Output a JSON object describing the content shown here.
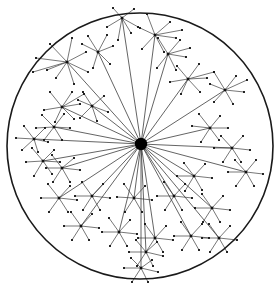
{
  "figure": {
    "type": "node-link-diagram",
    "width": 280,
    "height": 292,
    "background_color": "#ffffff"
  },
  "style": {
    "boundary_stroke": "#1a1a1a",
    "boundary_stroke_width": 1.6,
    "boundary_fill": "none",
    "spoke_stroke": "#3c3c3c",
    "spoke_stroke_width": 0.8,
    "branch_stroke": "#3c3c3c",
    "branch_stroke_width": 0.7,
    "hub_fill": "#000000",
    "cluster_node_fill": "#111111",
    "leaf_node_fill": "#111111",
    "hub_radius": 6.2,
    "cluster_node_size": 2.6,
    "leaf_node_size": 1.9
  },
  "boundary": {
    "label": "outer-circle-boundary",
    "cx": 140,
    "cy": 146,
    "r": 133
  },
  "hub": {
    "label": "central-hub-node",
    "cx": 141,
    "cy": 144,
    "r": 6.2,
    "degree": 29
  },
  "chart_data": {
    "type": "node-link-diagram",
    "node_count": 213,
    "cluster_count": 29,
    "clusters": [
      {
        "id": "c01",
        "x": 122,
        "y": 18,
        "leaves": [
          [
            113,
            8
          ],
          [
            134,
            9
          ],
          [
            107,
            27
          ],
          [
            131,
            33
          ],
          [
            118,
            40
          ],
          [
            140,
            28
          ]
        ]
      },
      {
        "id": "c02",
        "x": 155,
        "y": 35,
        "leaves": [
          [
            147,
            14
          ],
          [
            170,
            22
          ],
          [
            176,
            38
          ],
          [
            164,
            52
          ],
          [
            142,
            49
          ],
          [
            138,
            27
          ],
          [
            182,
            30
          ]
        ]
      },
      {
        "id": "c03",
        "x": 67,
        "y": 62,
        "leaves": [
          [
            50,
            44
          ],
          [
            72,
            38
          ],
          [
            86,
            52
          ],
          [
            88,
            72
          ],
          [
            74,
            84
          ],
          [
            56,
            78
          ],
          [
            36,
            58
          ],
          [
            47,
            70
          ],
          [
            33,
            72
          ]
        ]
      },
      {
        "id": "c04",
        "x": 98,
        "y": 52,
        "leaves": [
          [
            88,
            36
          ],
          [
            107,
            35
          ],
          [
            113,
            46
          ],
          [
            110,
            64
          ],
          [
            93,
            68
          ],
          [
            82,
            44
          ]
        ]
      },
      {
        "id": "c05",
        "x": 168,
        "y": 54,
        "leaves": [
          [
            158,
            38
          ],
          [
            180,
            40
          ],
          [
            186,
            57
          ],
          [
            176,
            70
          ],
          [
            157,
            68
          ],
          [
            190,
            48
          ]
        ]
      },
      {
        "id": "c06",
        "x": 188,
        "y": 79,
        "leaves": [
          [
            177,
            66
          ],
          [
            199,
            64
          ],
          [
            207,
            78
          ],
          [
            200,
            92
          ],
          [
            181,
            94
          ],
          [
            170,
            82
          ],
          [
            214,
            72
          ]
        ]
      },
      {
        "id": "c07",
        "x": 225,
        "y": 90,
        "leaves": [
          [
            214,
            72
          ],
          [
            236,
            76
          ],
          [
            244,
            92
          ],
          [
            233,
            104
          ],
          [
            214,
            102
          ],
          [
            210,
            84
          ],
          [
            247,
            80
          ]
        ]
      },
      {
        "id": "c08",
        "x": 62,
        "y": 107,
        "leaves": [
          [
            50,
            92
          ],
          [
            72,
            92
          ],
          [
            80,
            104
          ],
          [
            74,
            119
          ],
          [
            55,
            122
          ],
          [
            44,
            110
          ],
          [
            84,
            94
          ]
        ]
      },
      {
        "id": "c09",
        "x": 92,
        "y": 106,
        "leaves": [
          [
            83,
            92
          ],
          [
            104,
            96
          ],
          [
            108,
            112
          ],
          [
            97,
            121
          ],
          [
            80,
            118
          ],
          [
            78,
            100
          ]
        ]
      },
      {
        "id": "c10",
        "x": 210,
        "y": 128,
        "leaves": [
          [
            199,
            114
          ],
          [
            220,
            116
          ],
          [
            228,
            128
          ],
          [
            219,
            140
          ],
          [
            201,
            142
          ],
          [
            192,
            126
          ]
        ]
      },
      {
        "id": "c11",
        "x": 54,
        "y": 127,
        "leaves": [
          [
            42,
            115
          ],
          [
            64,
            114
          ],
          [
            70,
            128
          ],
          [
            62,
            140
          ],
          [
            44,
            140
          ],
          [
            36,
            128
          ]
        ]
      },
      {
        "id": "c12",
        "x": 34,
        "y": 139,
        "leaves": [
          [
            24,
            126
          ],
          [
            45,
            128
          ],
          [
            48,
            142
          ],
          [
            38,
            152
          ],
          [
            22,
            150
          ],
          [
            16,
            138
          ]
        ]
      },
      {
        "id": "c13",
        "x": 43,
        "y": 161,
        "leaves": [
          [
            32,
            148
          ],
          [
            54,
            150
          ],
          [
            60,
            162
          ],
          [
            52,
            174
          ],
          [
            34,
            176
          ],
          [
            26,
            162
          ]
        ]
      },
      {
        "id": "c14",
        "x": 62,
        "y": 168,
        "leaves": [
          [
            52,
            155
          ],
          [
            74,
            158
          ],
          [
            80,
            170
          ],
          [
            70,
            182
          ],
          [
            53,
            182
          ],
          [
            46,
            168
          ]
        ]
      },
      {
        "id": "c15",
        "x": 232,
        "y": 148,
        "leaves": [
          [
            221,
            136
          ],
          [
            243,
            136
          ],
          [
            250,
            150
          ],
          [
            241,
            162
          ],
          [
            223,
            162
          ],
          [
            214,
            148
          ]
        ]
      },
      {
        "id": "c16",
        "x": 246,
        "y": 172,
        "leaves": [
          [
            235,
            160
          ],
          [
            256,
            160
          ],
          [
            263,
            174
          ],
          [
            254,
            186
          ],
          [
            236,
            186
          ],
          [
            228,
            172
          ]
        ]
      },
      {
        "id": "c17",
        "x": 194,
        "y": 176,
        "leaves": [
          [
            184,
            163
          ],
          [
            205,
            164
          ],
          [
            212,
            178
          ],
          [
            202,
            190
          ],
          [
            185,
            191
          ],
          [
            177,
            176
          ]
        ]
      },
      {
        "id": "c18",
        "x": 59,
        "y": 198,
        "leaves": [
          [
            48,
            184
          ],
          [
            70,
            186
          ],
          [
            77,
            200
          ],
          [
            68,
            212
          ],
          [
            49,
            212
          ],
          [
            41,
            198
          ]
        ]
      },
      {
        "id": "c19",
        "x": 92,
        "y": 196,
        "leaves": [
          [
            82,
            182
          ],
          [
            103,
            184
          ],
          [
            110,
            198
          ],
          [
            100,
            210
          ],
          [
            83,
            210
          ],
          [
            75,
            196
          ]
        ]
      },
      {
        "id": "c20",
        "x": 134,
        "y": 198,
        "leaves": [
          [
            124,
            184
          ],
          [
            145,
            186
          ],
          [
            152,
            200
          ],
          [
            142,
            212
          ],
          [
            125,
            212
          ],
          [
            117,
            197
          ]
        ]
      },
      {
        "id": "c21",
        "x": 174,
        "y": 196,
        "leaves": [
          [
            164,
            182
          ],
          [
            185,
            184
          ],
          [
            192,
            198
          ],
          [
            182,
            210
          ],
          [
            165,
            210
          ],
          [
            157,
            196
          ]
        ]
      },
      {
        "id": "c22",
        "x": 212,
        "y": 208,
        "leaves": [
          [
            202,
            194
          ],
          [
            223,
            196
          ],
          [
            230,
            210
          ],
          [
            220,
            222
          ],
          [
            203,
            222
          ],
          [
            195,
            208
          ]
        ]
      },
      {
        "id": "c23",
        "x": 81,
        "y": 226,
        "leaves": [
          [
            71,
            212
          ],
          [
            92,
            214
          ],
          [
            99,
            228
          ],
          [
            89,
            240
          ],
          [
            72,
            240
          ],
          [
            64,
            226
          ]
        ]
      },
      {
        "id": "c24",
        "x": 119,
        "y": 232,
        "leaves": [
          [
            109,
            218
          ],
          [
            130,
            220
          ],
          [
            137,
            234
          ],
          [
            127,
            246
          ],
          [
            110,
            246
          ],
          [
            102,
            232
          ]
        ]
      },
      {
        "id": "c25",
        "x": 155,
        "y": 238,
        "leaves": [
          [
            145,
            224
          ],
          [
            166,
            226
          ],
          [
            173,
            240
          ],
          [
            163,
            252
          ],
          [
            146,
            252
          ],
          [
            138,
            238
          ]
        ]
      },
      {
        "id": "c26",
        "x": 191,
        "y": 236,
        "leaves": [
          [
            181,
            222
          ],
          [
            202,
            224
          ],
          [
            209,
            238
          ],
          [
            199,
            250
          ],
          [
            182,
            250
          ],
          [
            174,
            236
          ]
        ]
      },
      {
        "id": "c27",
        "x": 219,
        "y": 238,
        "leaves": [
          [
            209,
            224
          ],
          [
            230,
            226
          ],
          [
            237,
            240
          ],
          [
            227,
            252
          ],
          [
            210,
            252
          ],
          [
            202,
            238
          ]
        ]
      },
      {
        "id": "c28",
        "x": 146,
        "y": 252,
        "leaves": [
          [
            136,
            240
          ],
          [
            157,
            242
          ],
          [
            163,
            256
          ],
          [
            153,
            266
          ],
          [
            137,
            266
          ],
          [
            129,
            252
          ]
        ]
      },
      {
        "id": "c29",
        "x": 141,
        "y": 268,
        "leaves": [
          [
            131,
            258
          ],
          [
            152,
            260
          ],
          [
            158,
            272
          ],
          [
            148,
            282
          ],
          [
            132,
            282
          ],
          [
            124,
            268
          ]
        ]
      }
    ]
  }
}
